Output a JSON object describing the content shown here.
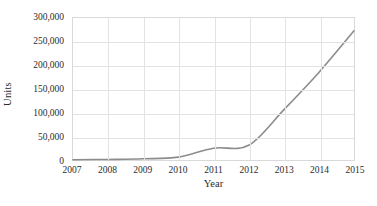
{
  "chart_data": {
    "type": "line",
    "title": "",
    "xlabel": "Year",
    "ylabel": "Units",
    "x": [
      2007,
      2008,
      2009,
      2010,
      2011,
      2012,
      2013,
      2014,
      2015
    ],
    "categories": [
      "2007",
      "2008",
      "2009",
      "2010",
      "2011",
      "2012",
      "2013",
      "2014",
      "2015"
    ],
    "series": [
      {
        "name": "Units",
        "values": [
          500,
          1200,
          2500,
          6000,
          25000,
          31000,
          106000,
          185000,
          273000
        ],
        "color": "#8c8c8c"
      }
    ],
    "xlim": [
      2007,
      2015
    ],
    "ylim": [
      0,
      300000
    ],
    "ytick_values": [
      0,
      50000,
      100000,
      150000,
      200000,
      250000,
      300000
    ],
    "ytick_labels": [
      "0",
      "50,000",
      "100,000",
      "150,000",
      "200,000",
      "250,000",
      "300,000"
    ],
    "xtick_labels": [
      "2007",
      "2008",
      "2009",
      "2010",
      "2011",
      "2012",
      "2013",
      "2014",
      "2015"
    ],
    "grid": true,
    "grid_axes": "both",
    "legend": false,
    "legend_position": "none",
    "smoothed": true,
    "colors": {
      "line": "#8c8c8c",
      "grid": "#e3e3e3",
      "plot_border": "#d9d9d9",
      "background": "#ffffff",
      "text": "#2b2b2b"
    }
  }
}
